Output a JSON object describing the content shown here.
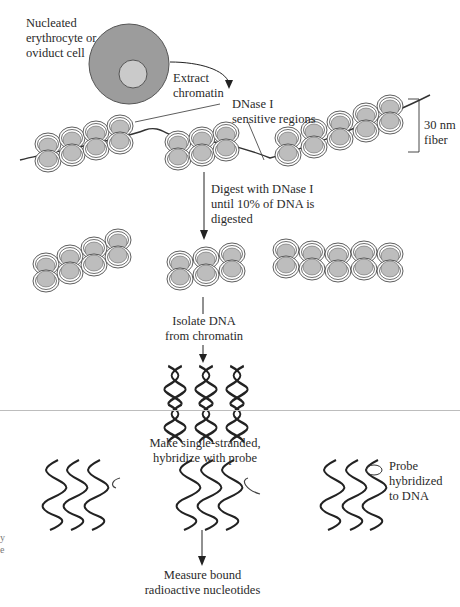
{
  "figure": {
    "colors": {
      "cell_cytoplasm": "#9c9c9c",
      "cell_nucleus": "#cacaca",
      "nucleosome": "#bdbdbd",
      "stroke": "#333333",
      "page_rule": "#bdbdbd"
    }
  },
  "labels": {
    "cell": [
      "Nucleated",
      "erythrocyte or",
      "oviduct cell"
    ],
    "extract": [
      "Extract",
      "chromatin"
    ],
    "dnase_regions": [
      "DNase I",
      "sensitive regions"
    ],
    "fiber": [
      "30 nm",
      "fiber"
    ],
    "digest": [
      "Digest with DNase I",
      "until 10% of DNA is",
      "digested"
    ],
    "isolate": [
      "Isolate DNA",
      "from chromatin"
    ],
    "single_strand": [
      "Make single-stranded,",
      "hybridize with probe"
    ],
    "probe": [
      "Probe",
      "hybridized",
      "to DNA"
    ],
    "measure": [
      "Measure bound",
      "radioactive nucleotides"
    ],
    "edge_fragments": [
      "y",
      "e"
    ]
  },
  "steps": [
    {
      "order": 1,
      "name": "Extract chromatin"
    },
    {
      "order": 2,
      "name": "Digest with DNase I until 10% of DNA is digested"
    },
    {
      "order": 3,
      "name": "Isolate DNA from chromatin"
    },
    {
      "order": 4,
      "name": "Make single-stranded, hybridize with probe"
    },
    {
      "order": 5,
      "name": "Measure bound radioactive nucleotides"
    }
  ]
}
